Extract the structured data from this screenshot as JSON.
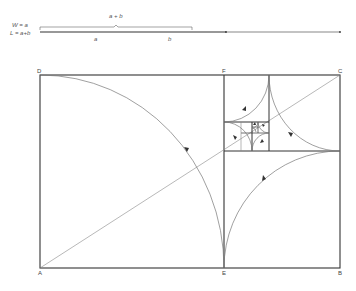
{
  "header": {
    "width_label": "W = a",
    "length_label": "L = a+b",
    "sum_label": "a + b",
    "segment_a": "a",
    "segment_b": "b"
  },
  "points": {
    "A": "A",
    "B": "B",
    "C": "C",
    "D": "D",
    "E": "E",
    "F": "F"
  },
  "colors": {
    "frame": "#333333",
    "curve": "#777777",
    "diagonal": "#888888"
  }
}
